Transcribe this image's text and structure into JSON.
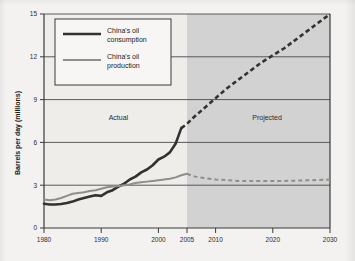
{
  "chart_data": {
    "type": "line",
    "title": "",
    "xlabel": "",
    "ylabel": "Barrels per day (millions)",
    "xlim": [
      1980,
      2030
    ],
    "ylim": [
      0,
      15
    ],
    "yticks": [
      0,
      3,
      6,
      9,
      12,
      15
    ],
    "ytick_labels": [
      "0",
      "3",
      "6",
      "9",
      "12",
      "15"
    ],
    "xticks": [
      1980,
      1990,
      2000,
      2005,
      2010,
      2020,
      2030
    ],
    "xtick_labels": [
      "1980",
      "1990",
      "2000",
      "2005",
      "2010",
      "2020",
      "2030"
    ],
    "grid": "horizontal",
    "legend_position": "top-left-inside",
    "split_year": 2005,
    "annotations": [
      {
        "text": "Actual",
        "x": 1993,
        "y": 7.6
      },
      {
        "text": "Projected",
        "x": 2019,
        "y": 7.6
      }
    ],
    "shaded_region": {
      "label": "Projected",
      "from": 2005,
      "to": 2030,
      "color": "#d2d2d2"
    },
    "series": [
      {
        "name": "China's oil consumption",
        "color": "#33322f",
        "actual": {
          "x": [
            1980,
            1981,
            1982,
            1983,
            1984,
            1985,
            1986,
            1987,
            1988,
            1989,
            1990,
            1991,
            1992,
            1993,
            1994,
            1995,
            1996,
            1997,
            1998,
            1999,
            2000,
            2001,
            2002,
            2003,
            2004
          ],
          "y": [
            1.7,
            1.65,
            1.65,
            1.68,
            1.75,
            1.85,
            2.0,
            2.1,
            2.2,
            2.3,
            2.25,
            2.5,
            2.65,
            2.9,
            3.1,
            3.4,
            3.6,
            3.9,
            4.1,
            4.4,
            4.8,
            5.0,
            5.3,
            5.9,
            7.0
          ]
        },
        "projected": {
          "x": [
            2004,
            2005,
            2006,
            2008,
            2010,
            2012,
            2014,
            2016,
            2018,
            2020,
            2022,
            2024,
            2026,
            2028,
            2030
          ],
          "y": [
            7.0,
            7.3,
            7.7,
            8.4,
            9.1,
            9.8,
            10.4,
            11.0,
            11.6,
            12.1,
            12.6,
            13.2,
            13.8,
            14.4,
            15.0
          ]
        }
      },
      {
        "name": "China's oil production",
        "color": "#8e8e8b",
        "actual": {
          "x": [
            1980,
            1981,
            1982,
            1983,
            1984,
            1985,
            1986,
            1987,
            1988,
            1989,
            1990,
            1991,
            1992,
            1993,
            1994,
            1995,
            1996,
            1997,
            1998,
            1999,
            2000,
            2001,
            2002,
            2003,
            2004,
            2005
          ],
          "y": [
            2.0,
            1.95,
            2.0,
            2.1,
            2.25,
            2.4,
            2.45,
            2.5,
            2.6,
            2.65,
            2.75,
            2.85,
            2.9,
            2.95,
            3.0,
            3.05,
            3.15,
            3.2,
            3.25,
            3.3,
            3.35,
            3.4,
            3.45,
            3.55,
            3.7,
            3.8
          ]
        },
        "projected": {
          "x": [
            2005,
            2006,
            2007,
            2008,
            2010,
            2012,
            2014,
            2016,
            2018,
            2020,
            2022,
            2024,
            2026,
            2028,
            2030
          ],
          "y": [
            3.8,
            3.65,
            3.55,
            3.5,
            3.4,
            3.35,
            3.3,
            3.3,
            3.3,
            3.3,
            3.3,
            3.32,
            3.34,
            3.36,
            3.4
          ]
        }
      }
    ]
  },
  "legend": {
    "items": [
      {
        "label_line1": "China's oil",
        "label_line2": "consumption",
        "color": "#33322f"
      },
      {
        "label_line1": "China's oil",
        "label_line2": "production",
        "color": "#8e8e8b"
      }
    ]
  },
  "axes": {
    "y_title": "Barrels per day (millions)",
    "y_labels": [
      "15",
      "12",
      "9",
      "6",
      "3",
      "0"
    ],
    "x_labels": [
      "1980",
      "1990",
      "2000",
      "2005",
      "2010",
      "2020",
      "2030"
    ]
  },
  "regions": {
    "actual_label": "Actual",
    "projected_label": "Projected"
  },
  "colors": {
    "page_background": "#f3f2f0",
    "plot_background": "#eeedea",
    "shade": "#d2d2d2",
    "grid": "#4a4a48",
    "axis": "#3a3a38",
    "consumption": "#33322f",
    "production": "#8e8e8b"
  }
}
